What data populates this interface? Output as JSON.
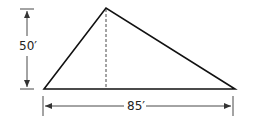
{
  "diagram": {
    "type": "triangle-dimensions",
    "height_label": "50′",
    "base_label": "85′",
    "height_value_ft": 50,
    "base_value_ft": 85,
    "colors": {
      "stroke": "#111111",
      "dimension": "#333333"
    }
  }
}
